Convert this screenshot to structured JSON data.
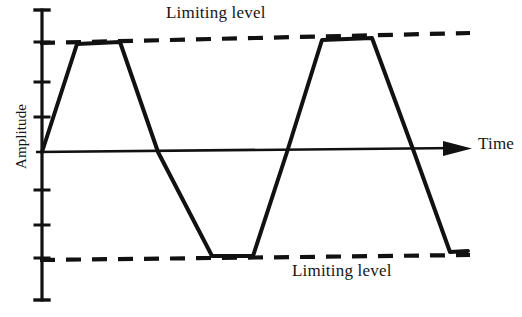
{
  "figure": {
    "kind": "waveform-clipping-diagram",
    "background_color": "#ffffff",
    "ink_color": "#111111",
    "width": 522,
    "height": 317
  },
  "labels": {
    "y_axis_title": "Amplitude",
    "x_axis_title": "Time",
    "upper_limit": "Limiting level",
    "lower_limit": "Limiting level"
  },
  "chart_data": {
    "type": "line",
    "title": "",
    "xlabel": "Time",
    "ylabel": "Amplitude",
    "grid": false,
    "legend": false,
    "annotations": [
      {
        "text": "Limiting level",
        "target": "upper-limit-line",
        "x": 166,
        "y": 12
      },
      {
        "text": "Limiting level",
        "target": "lower-limit-line",
        "x": 292,
        "y": 270
      }
    ],
    "axes": {
      "y_axis_x": 42,
      "y_axis_top": 10,
      "y_axis_bottom": 300,
      "zero_level_y": 152,
      "x_axis_start": 42,
      "x_axis_end": 470,
      "tick_x_start": 35,
      "tick_x_end": 49,
      "tick_positions_y": [
        10,
        42,
        82,
        117,
        152,
        190,
        225,
        258,
        300
      ],
      "arrow_tip_x": 472,
      "arrow_tail_x": 440
    },
    "limit_lines": [
      {
        "name": "upper-limit-line",
        "style": "dashed",
        "x1": 40,
        "y1": 43,
        "x2": 470,
        "y2": 33
      },
      {
        "name": "lower-limit-line",
        "style": "dashed",
        "x1": 40,
        "y1": 260,
        "x2": 470,
        "y2": 255
      }
    ],
    "waveform": {
      "name": "clipped-signal",
      "style": "solid",
      "description": "Trapezoidal clipped sine wave, two cycles, flat-topped at the limiting levels",
      "points": [
        [
          42,
          152
        ],
        [
          77,
          44
        ],
        [
          120,
          42
        ],
        [
          158,
          152
        ],
        [
          212,
          256
        ],
        [
          253,
          256
        ],
        [
          287,
          152
        ],
        [
          322,
          40
        ],
        [
          372,
          38
        ],
        [
          414,
          152
        ],
        [
          450,
          252
        ],
        [
          468,
          251
        ]
      ]
    }
  }
}
